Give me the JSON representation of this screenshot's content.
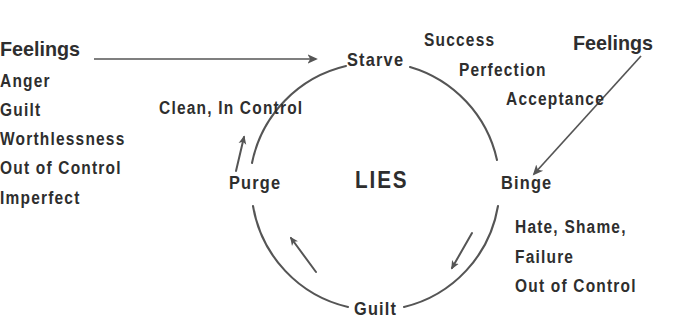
{
  "diagram": {
    "title_center": "LIES",
    "cycle_nodes": [
      {
        "id": "starve",
        "label": "Starve"
      },
      {
        "id": "binge",
        "label": "Binge"
      },
      {
        "id": "guilt",
        "label": "Guilt"
      },
      {
        "id": "purge",
        "label": "Purge"
      }
    ],
    "left_block": {
      "heading": "Feelings",
      "items": [
        "Anger",
        "Guilt",
        "Worthlessness",
        "Out of Control",
        "Imperfect"
      ]
    },
    "right_heading": "Feelings",
    "purge_annotation": "Clean, In Control",
    "starve_annotations": [
      "Success",
      "Perfection",
      "Acceptance"
    ],
    "binge_annotations": [
      "Hate, Shame,",
      "Failure",
      "Out of Control"
    ],
    "colors": {
      "ink": "#2e2e2e",
      "stroke": "#555555",
      "background": "#ffffff"
    }
  }
}
